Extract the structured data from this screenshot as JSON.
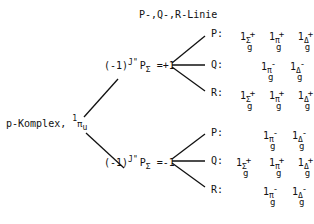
{
  "header": {
    "title": "P-,Q-,R-Linie"
  },
  "root": {
    "label": "p-Komplex,",
    "state_one": "1",
    "state_sym": "π",
    "state_sub": "u"
  },
  "branches": [
    {
      "cond_prefix": "(-1)",
      "cond_sup": "J\"",
      "cond_P": "P",
      "cond_sub": "Σ",
      "cond_value": "=+1",
      "lines": [
        {
          "label": "P:",
          "terms": [
            {
              "sym": "Σ",
              "sup": "+",
              "sub": "g"
            },
            {
              "sym": "π",
              "sup": "+",
              "sub": "g"
            },
            {
              "sym": "Δ",
              "sup": "+",
              "sub": "g"
            }
          ]
        },
        {
          "label": "Q:",
          "terms": [
            {
              "sym": "π",
              "sup": "-",
              "sub": "g"
            },
            {
              "sym": "Δ",
              "sup": "-",
              "sub": "g"
            }
          ]
        },
        {
          "label": "R:",
          "terms": [
            {
              "sym": "Σ",
              "sup": "+",
              "sub": "g"
            },
            {
              "sym": "π",
              "sup": "+",
              "sub": "g"
            },
            {
              "sym": "Δ",
              "sup": "+",
              "sub": "g"
            }
          ]
        }
      ]
    },
    {
      "cond_prefix": "(-1)",
      "cond_sup": "J\"",
      "cond_P": "P",
      "cond_sub": "Σ",
      "cond_value": "=-1",
      "lines": [
        {
          "label": "P:",
          "terms": [
            {
              "sym": "π",
              "sup": "-",
              "sub": "g"
            },
            {
              "sym": "Δ",
              "sup": "-",
              "sub": "g"
            }
          ]
        },
        {
          "label": "Q:",
          "terms": [
            {
              "sym": "Σ",
              "sup": "+",
              "sub": "g"
            },
            {
              "sym": "π",
              "sup": "+",
              "sub": "g"
            },
            {
              "sym": "Δ",
              "sup": "+",
              "sub": "g"
            }
          ]
        },
        {
          "label": "R:",
          "terms": [
            {
              "sym": "π",
              "sup": "-",
              "sub": "g"
            },
            {
              "sym": "Δ",
              "sup": "-",
              "sub": "g"
            }
          ]
        }
      ]
    }
  ],
  "term_prefix": "1",
  "colors": {
    "ink": "#111111",
    "background": "#ffffff"
  }
}
